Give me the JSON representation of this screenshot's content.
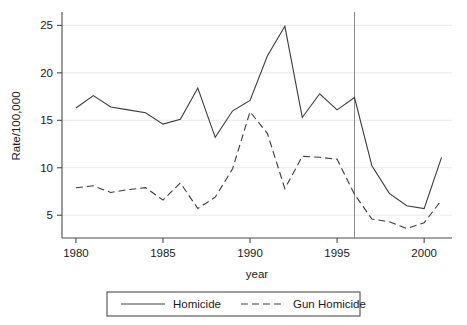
{
  "chart_data": {
    "type": "line",
    "title": "",
    "xlabel": "year",
    "ylabel": "Rate/100,000",
    "xlim": [
      1979.2,
      2001.6
    ],
    "ylim": [
      2.6,
      26.2
    ],
    "xticks": [
      1980,
      1985,
      1990,
      1995,
      2000
    ],
    "yticks": [
      5,
      10,
      15,
      20,
      25
    ],
    "grid": "horizontal",
    "legend_position": "bottom",
    "x": [
      1980,
      1981,
      1982,
      1983,
      1984,
      1985,
      1986,
      1987,
      1988,
      1989,
      1990,
      1991,
      1992,
      1993,
      1994,
      1995,
      1996,
      1997,
      1998,
      1999,
      2000,
      2001
    ],
    "series": [
      {
        "name": "Homicide",
        "style": "solid",
        "color": "#3c3c3c",
        "values": [
          16.3,
          17.6,
          16.4,
          16.1,
          15.8,
          14.6,
          15.1,
          18.4,
          13.2,
          16.0,
          17.1,
          21.8,
          24.9,
          15.3,
          17.8,
          16.1,
          17.4,
          10.2,
          7.3,
          6.0,
          5.7,
          11.1
        ]
      },
      {
        "name": "Gun Homicide",
        "style": "dashed",
        "color": "#3c3c3c",
        "values": [
          7.9,
          8.1,
          7.4,
          7.7,
          7.9,
          6.6,
          8.4,
          5.7,
          6.9,
          9.9,
          15.9,
          13.6,
          7.8,
          11.2,
          11.1,
          10.9,
          7.2,
          4.6,
          4.3,
          3.6,
          4.2,
          6.6
        ]
      }
    ],
    "annotations": [
      {
        "type": "vertical-line",
        "x": 1996,
        "label": ""
      }
    ],
    "legend": [
      {
        "label": "Homicide",
        "style": "solid"
      },
      {
        "label": "Gun Homicide",
        "style": "dashed"
      }
    ]
  }
}
